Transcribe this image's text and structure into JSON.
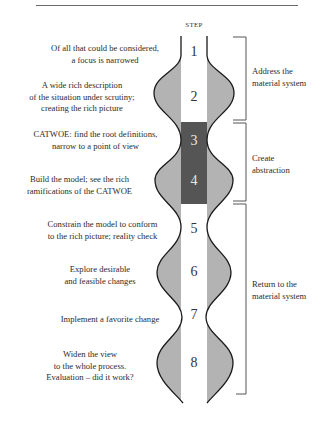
{
  "diagram": {
    "column_title": "STEP",
    "colors": {
      "outline": "#1a1a1a",
      "bulge_fill": "#b3b3b3",
      "column_fill": "#ffffff",
      "abstraction_fill": "#555555",
      "bracket": "#555555"
    },
    "steps": [
      {
        "number": "1",
        "description": [
          "Of all that could be considered,",
          "a focus is narrowed"
        ]
      },
      {
        "number": "2",
        "description": [
          "A wide rich description",
          "of the situation under scrutiny;",
          "creating the rich picture"
        ]
      },
      {
        "number": "3",
        "description": [
          "CATWOE: find the root definitions,",
          "narrow to a point of view"
        ]
      },
      {
        "number": "4",
        "description": [
          "Build the model; see the rich",
          "ramifications of the CATWOE"
        ]
      },
      {
        "number": "5",
        "description": [
          "Constrain the model to conform",
          "to the rich picture; reality check"
        ]
      },
      {
        "number": "6",
        "description": [
          "Explore desirable",
          "and feasible changes"
        ]
      },
      {
        "number": "7",
        "description": [
          "Implement a favorite change"
        ]
      },
      {
        "number": "8",
        "description": [
          "Widen the view",
          "to the whole process.",
          "Evaluation – did it work?"
        ]
      }
    ],
    "phases": [
      {
        "label": [
          "Address the",
          "material system"
        ],
        "steps": "1-2"
      },
      {
        "label": [
          "Create",
          "abstraction"
        ],
        "steps": "3-4"
      },
      {
        "label": [
          "Return to the",
          "material system"
        ],
        "steps": "5-8"
      }
    ]
  }
}
